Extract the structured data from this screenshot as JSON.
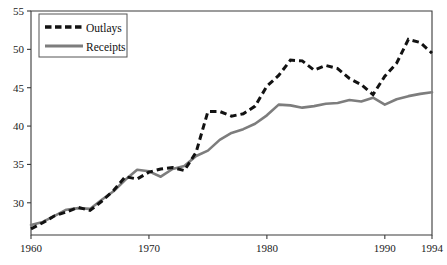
{
  "chart_data": {
    "type": "line",
    "title": "",
    "subtitle": "",
    "xlabel": "",
    "ylabel": "",
    "xlim": [
      1960,
      1994
    ],
    "ylim": [
      25.8,
      55
    ],
    "grid": false,
    "legend_position": "top-left",
    "x_ticks": [
      "1960",
      "1970",
      "1980",
      "1990",
      "1994"
    ],
    "x_tick_values": [
      1960,
      1970,
      1980,
      1990,
      1994
    ],
    "y_ticks": [
      "30",
      "35",
      "40",
      "45",
      "50",
      "55"
    ],
    "y_tick_values": [
      30,
      35,
      40,
      45,
      50,
      55
    ],
    "x": [
      1960,
      1961,
      1962,
      1963,
      1964,
      1965,
      1966,
      1967,
      1968,
      1969,
      1970,
      1971,
      1972,
      1973,
      1974,
      1975,
      1976,
      1977,
      1978,
      1979,
      1980,
      1981,
      1982,
      1983,
      1984,
      1985,
      1986,
      1987,
      1988,
      1989,
      1990,
      1991,
      1992,
      1993,
      1994
    ],
    "series": [
      {
        "name": "Outlays",
        "color": "#121212",
        "style": "dashed",
        "values": [
          26.6,
          27.4,
          28.3,
          28.8,
          29.4,
          29.0,
          30.2,
          31.6,
          33.4,
          33.1,
          34.0,
          34.4,
          34.6,
          34.2,
          36.6,
          41.9,
          41.9,
          41.3,
          41.6,
          42.6,
          45.2,
          46.6,
          48.6,
          48.5,
          47.3,
          47.9,
          47.5,
          46.2,
          45.4,
          44.1,
          46.5,
          48.2,
          51.3,
          50.9,
          49.5
        ]
      },
      {
        "name": "Receipts",
        "color": "#7d7d7d",
        "style": "solid",
        "values": [
          27.1,
          27.5,
          28.3,
          29.1,
          29.3,
          29.2,
          30.4,
          31.5,
          33.0,
          34.3,
          34.1,
          33.4,
          34.4,
          34.8,
          36.1,
          36.8,
          38.2,
          39.1,
          39.6,
          40.3,
          41.4,
          42.8,
          42.7,
          42.4,
          42.6,
          42.9,
          43.0,
          43.4,
          43.2,
          43.7,
          42.8,
          43.5,
          43.9,
          44.2,
          44.4
        ]
      }
    ],
    "legend": [
      {
        "label": "Outlays",
        "color": "#121212",
        "style": "dashed"
      },
      {
        "label": "Receipts",
        "color": "#7d7d7d",
        "style": "solid"
      }
    ]
  },
  "plot": {
    "left": 31,
    "right": 432,
    "top": 11,
    "bottom": 235
  }
}
